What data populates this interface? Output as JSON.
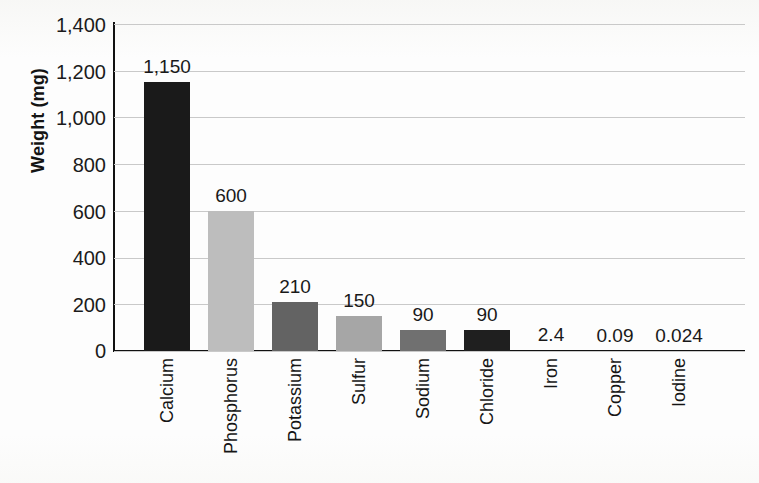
{
  "chart_data": {
    "type": "bar",
    "title": "",
    "subtitle": "",
    "xlabel": "",
    "ylabel": "Weight (mg)",
    "ylim": [
      0,
      1400
    ],
    "ytick_step": 200,
    "yticks": [
      "1,400",
      "1,200",
      "1,000",
      "800",
      "600",
      "400",
      "200",
      "0"
    ],
    "ytick_values": [
      1400,
      1200,
      1000,
      800,
      600,
      400,
      200,
      0
    ],
    "grid": true,
    "legend": "none",
    "categories": [
      "Calcium",
      "Phosphorus",
      "Potassium",
      "Sulfur",
      "Sodium",
      "Chloride",
      "Iron",
      "Copper",
      "Iodine"
    ],
    "values": [
      1150,
      600,
      210,
      150,
      90,
      90,
      2.4,
      0.09,
      0.024
    ],
    "value_labels": [
      "1,150",
      "600",
      "210",
      "150",
      "90",
      "90",
      "2.4",
      "0.09",
      "0.024"
    ],
    "bar_colors": [
      "#1a1a1a",
      "#bdbdbd",
      "#636363",
      "#a6a6a6",
      "#707070",
      "#1f1f1f",
      "#ffffff",
      "#ffffff",
      "#ffffff"
    ],
    "bars": [
      {
        "category": "Calcium",
        "value": 1150,
        "label": "1,150",
        "color": "#1a1a1a"
      },
      {
        "category": "Phosphorus",
        "value": 600,
        "label": "600",
        "color": "#bdbdbd"
      },
      {
        "category": "Potassium",
        "value": 210,
        "label": "210",
        "color": "#636363"
      },
      {
        "category": "Sulfur",
        "value": 150,
        "label": "150",
        "color": "#a6a6a6"
      },
      {
        "category": "Sodium",
        "value": 90,
        "label": "90",
        "color": "#707070"
      },
      {
        "category": "Chloride",
        "value": 90,
        "label": "90",
        "color": "#1f1f1f"
      },
      {
        "category": "Iron",
        "value": 2.4,
        "label": "2.4",
        "color": "#ffffff"
      },
      {
        "category": "Copper",
        "value": 0.09,
        "label": "0.09",
        "color": "#ffffff"
      },
      {
        "category": "Iodine",
        "value": 0.024,
        "label": "0.024",
        "color": "#ffffff"
      }
    ],
    "axis_color": "#111111",
    "gridline_color": "#c9c9c9",
    "background": "#ffffff"
  }
}
